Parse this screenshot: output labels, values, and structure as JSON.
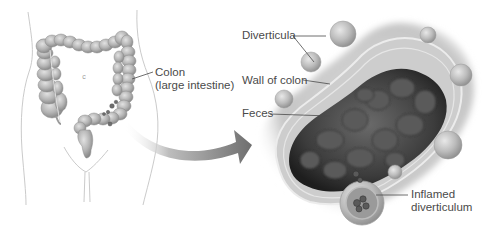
{
  "figure": {
    "background": "#ffffff",
    "colors": {
      "outline": "#b8b8b8",
      "colon_fill": "#bdbdbd",
      "colon_shade": "#8f8f8f",
      "arrow": "#7a7a7a",
      "wall": "#cfcfcf",
      "feces": "#3e3e3e",
      "label_text": "#4a4a4a",
      "leader_line": "#4a4a4a"
    }
  },
  "body_view": {
    "marker_letter": "c",
    "colon_label": {
      "line1": "Colon",
      "line2": "(large intestine)"
    }
  },
  "detail_view": {
    "labels": {
      "diverticula": "Diverticula",
      "wall_of_colon": "Wall of colon",
      "feces": "Feces",
      "inflamed_line1": "Inflamed",
      "inflamed_line2": "diverticulum"
    }
  }
}
